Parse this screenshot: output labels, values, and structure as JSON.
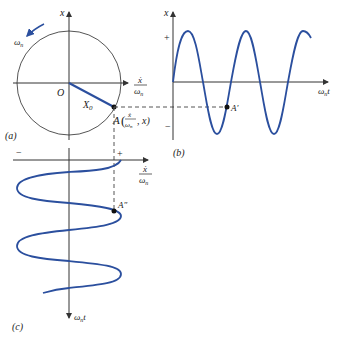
{
  "panels": {
    "a": {
      "label": "(a)",
      "axis_x_label_num": "ẋ",
      "axis_x_label_den": "ω",
      "axis_x_label_sub": "n",
      "axis_y_label": "x",
      "origin_label": "O",
      "radius_label": "X",
      "radius_label_sub": "0",
      "rotation_label": "ω",
      "rotation_label_sub": "n",
      "point_label_A": "A",
      "point_label_num": "ẋ",
      "point_label_den": "ω",
      "point_label_den_sub": "n",
      "point_label_tail": ", x)"
    },
    "b": {
      "label": "(b)",
      "axis_y_label": "x",
      "plus": "+",
      "minus": "−",
      "axis_x_label": "ω",
      "axis_x_label_sub": "n",
      "axis_x_label_t": "t",
      "point_label": "A′"
    },
    "c": {
      "label": "(c)",
      "minus": "−",
      "plus": "+",
      "axis_x_label_num": "ẋ",
      "axis_x_label_den": "ω",
      "axis_x_label_sub": "n",
      "axis_y_label": "ω",
      "axis_y_label_sub": "n",
      "axis_y_label_t": "t",
      "point_label": "A″"
    }
  },
  "colors": {
    "curve": "#2b4f9e",
    "axis": "#333333",
    "dashed": "#555555"
  }
}
